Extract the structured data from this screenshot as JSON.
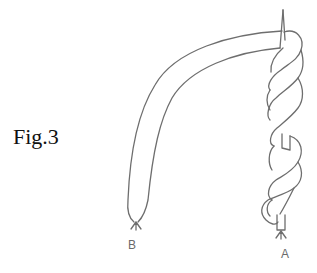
{
  "figure": {
    "label": "Fig.3",
    "points": [
      {
        "id": "B",
        "label": "B"
      },
      {
        "id": "A",
        "label": "A"
      }
    ],
    "colors": {
      "text": "#111111",
      "line": "#6e6e6e",
      "background": "#ffffff"
    }
  }
}
